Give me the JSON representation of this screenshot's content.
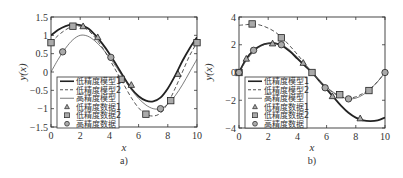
{
  "chart_data": [
    {
      "type": "line",
      "panel_label": "a)",
      "xlabel": "x",
      "ylabel": "y(x)",
      "xlim": [
        0,
        10
      ],
      "ylim": [
        -1.5,
        1.5
      ],
      "xticks": [
        "0",
        "2",
        "4",
        "6",
        "8",
        "10"
      ],
      "yticks": [
        "1.5",
        "1",
        "0.5",
        "0",
        "-0.5",
        "-1",
        "-1.5"
      ],
      "grid": false,
      "legend_position": "lower left",
      "legend": [
        "低精度模型1",
        "低精度模型2",
        "高精度模型",
        "低精度数据1",
        "低精度数据2",
        "高精度数据"
      ],
      "series": [
        {
          "name": "低精度模型1",
          "style": "thick-solid",
          "x": [
            0,
            0.5,
            1,
            1.5,
            2,
            2.5,
            3,
            3.5,
            4,
            4.5,
            5,
            5.5,
            6,
            6.5,
            7,
            7.5,
            8,
            8.5,
            9,
            9.5,
            10
          ],
          "y": [
            1.0,
            1.15,
            1.25,
            1.3,
            1.28,
            1.2,
            1.02,
            0.78,
            0.5,
            0.18,
            -0.15,
            -0.45,
            -0.66,
            -0.78,
            -0.8,
            -0.7,
            -0.45,
            -0.1,
            0.3,
            0.65,
            0.95
          ]
        },
        {
          "name": "低精度模型2",
          "style": "dashed",
          "x": [
            0,
            0.5,
            1,
            1.5,
            2,
            2.5,
            3,
            3.5,
            4,
            4.5,
            5,
            5.5,
            6,
            6.5,
            7,
            7.5,
            8,
            8.5,
            9,
            9.5,
            10
          ],
          "y": [
            0.8,
            1.0,
            1.15,
            1.25,
            1.25,
            1.15,
            0.95,
            0.68,
            0.35,
            0.0,
            -0.35,
            -0.7,
            -0.98,
            -1.15,
            -1.2,
            -1.12,
            -0.85,
            -0.45,
            0.0,
            0.45,
            0.8
          ]
        },
        {
          "name": "高精度模型",
          "style": "thin-solid",
          "x": [
            0,
            0.5,
            1,
            1.5,
            2,
            2.5,
            3,
            3.5,
            4,
            4.5,
            5,
            5.5,
            6,
            6.5,
            7,
            7.5,
            8,
            8.5,
            9,
            9.5,
            10
          ],
          "y": [
            0.0,
            0.35,
            0.65,
            0.88,
            1.0,
            0.98,
            0.85,
            0.65,
            0.4,
            0.12,
            -0.18,
            -0.48,
            -0.72,
            -0.9,
            -1.0,
            -1.0,
            -0.88,
            -0.65,
            -0.35,
            0.0,
            0.35
          ]
        },
        {
          "name": "低精度数据1",
          "marker": "triangle",
          "x": [
            2.2,
            3.2,
            5.5,
            8.7
          ],
          "y": [
            1.25,
            0.95,
            -0.35,
            -0.05
          ]
        },
        {
          "name": "低精度数据2",
          "marker": "square",
          "x": [
            0,
            1.5,
            4.8,
            6.5,
            8.2,
            10
          ],
          "y": [
            0.8,
            1.25,
            -0.2,
            -1.15,
            -0.78,
            0.8
          ]
        },
        {
          "name": "高精度数据",
          "marker": "circle",
          "x": [
            0.8,
            4.1,
            7.5
          ],
          "y": [
            0.55,
            0.4,
            -1.0
          ]
        }
      ]
    },
    {
      "type": "line",
      "panel_label": "b)",
      "xlabel": "x",
      "ylabel": "y(x)",
      "xlim": [
        0,
        10
      ],
      "ylim": [
        -4,
        4
      ],
      "xticks": [
        "0",
        "2",
        "4",
        "6",
        "8",
        "10"
      ],
      "yticks": [
        "4",
        "2",
        "0",
        "-2",
        "-4"
      ],
      "grid": false,
      "legend_position": "lower left",
      "legend": [
        "低精度模型1",
        "低精度模型2",
        "高精度模型",
        "低精度数据1",
        "低精度数据2",
        "高精度数据"
      ],
      "series": [
        {
          "name": "低精度模型1",
          "style": "thick-solid",
          "x": [
            0,
            0.5,
            1,
            1.5,
            2,
            2.5,
            3,
            3.5,
            4,
            4.5,
            5,
            5.5,
            6,
            6.5,
            7,
            7.5,
            8,
            8.5,
            9,
            9.5,
            10
          ],
          "y": [
            0,
            1.0,
            1.6,
            1.95,
            2.1,
            2.1,
            1.9,
            1.5,
            1.0,
            0.5,
            0,
            -0.6,
            -1.2,
            -1.8,
            -2.4,
            -2.9,
            -3.25,
            -3.45,
            -3.5,
            -3.45,
            -3.25
          ]
        },
        {
          "name": "低精度模型2",
          "style": "dashed",
          "x": [
            0,
            0.5,
            1,
            1.5,
            2,
            2.5,
            3,
            3.5,
            4,
            4.5,
            5,
            5.5,
            6,
            6.5,
            7,
            7.5,
            8,
            8.5,
            9,
            9.5,
            10
          ],
          "y": [
            3.4,
            3.45,
            3.5,
            3.4,
            3.2,
            2.9,
            2.45,
            1.9,
            1.3,
            0.65,
            0,
            -0.6,
            -1.1,
            -1.5,
            -1.75,
            -1.85,
            -1.75,
            -1.5,
            -1.15,
            -0.65,
            0.0
          ]
        },
        {
          "name": "高精度模型",
          "style": "thin-solid",
          "x": [
            0,
            0.5,
            1,
            1.5,
            2,
            2.5,
            3,
            3.5,
            4,
            4.5,
            5,
            5.5,
            6,
            6.5,
            7,
            7.5,
            8,
            8.5,
            9,
            9.5,
            10
          ],
          "y": [
            0,
            0.85,
            1.5,
            1.9,
            2.1,
            2.1,
            1.95,
            1.6,
            1.1,
            0.55,
            0,
            -0.55,
            -1.05,
            -1.45,
            -1.75,
            -1.9,
            -1.85,
            -1.6,
            -1.2,
            -0.65,
            0.0
          ]
        },
        {
          "name": "低精度数据1",
          "marker": "triangle",
          "x": [
            0.5,
            2.3,
            4.4,
            6.4,
            8.3
          ],
          "y": [
            1.0,
            2.1,
            0.7,
            -1.7,
            -3.3
          ]
        },
        {
          "name": "低精度数据2",
          "marker": "square",
          "x": [
            0,
            0.9,
            2.9,
            5,
            6.9,
            8.9
          ],
          "y": [
            0,
            3.5,
            2.5,
            0,
            -1.6,
            -1.3
          ]
        },
        {
          "name": "高精度数据",
          "marker": "circle",
          "x": [
            0,
            1.0,
            2.9,
            5.9,
            7.5,
            10
          ],
          "y": [
            0,
            1.6,
            2.0,
            -1.1,
            -1.9,
            0
          ]
        }
      ]
    }
  ],
  "panels": [
    {
      "ox": 51,
      "oy": 17,
      "w": 146,
      "h": 110,
      "caption_x": 124,
      "caption_y": 164,
      "xlabel_x": 124,
      "xlabel_y": 151,
      "ylabel_x": 26,
      "ylabel_y": 72,
      "legend": {
        "x": 57,
        "y": 77,
        "w": 62,
        "h": 51
      }
    },
    {
      "ox": 239,
      "oy": 17,
      "w": 146,
      "h": 111,
      "caption_x": 312,
      "caption_y": 164,
      "xlabel_x": 312,
      "xlabel_y": 151,
      "ylabel_x": 212,
      "ylabel_y": 72,
      "legend": {
        "x": 245,
        "y": 77,
        "w": 62,
        "h": 51
      }
    }
  ],
  "colors": {
    "line": "#222222",
    "dashed": "#555555",
    "thin": "#444444",
    "marker_fill": "#aaaaaa",
    "frame": "#333333"
  }
}
